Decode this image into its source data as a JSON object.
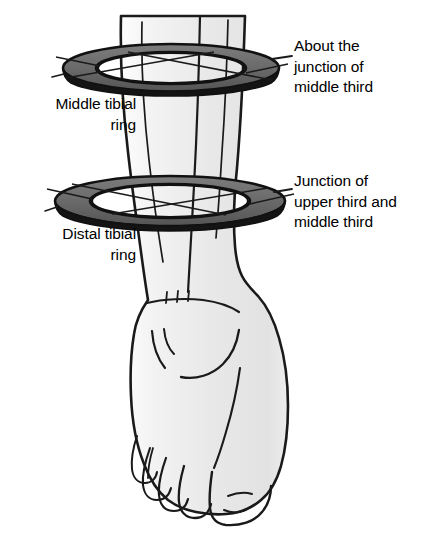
{
  "figure": {
    "type": "anatomical-line-diagram",
    "background_color": "#ffffff"
  },
  "labels": {
    "upper_right": {
      "text": "About the\njunction of\nmiddle third",
      "lines": [
        "About the",
        "junction of",
        "middle third"
      ],
      "align": "left",
      "color": "#000000",
      "points_to": "middle-tibial-ring"
    },
    "lower_right": {
      "text": "Junction of\nupper third and\nmiddle third",
      "lines": [
        "Junction of",
        "upper third and",
        "middle third"
      ],
      "align": "left",
      "color": "#000000",
      "points_to": "distal-tibial-ring"
    },
    "upper_left": {
      "text": "Middle tibial\nring",
      "lines": [
        "Middle tibial",
        "ring"
      ],
      "align": "right",
      "color": "#000000",
      "points_to": "middle-tibial-ring"
    },
    "lower_left": {
      "text": "Distal tibial\nring",
      "lines": [
        "Distal tibial",
        "ring"
      ],
      "align": "right",
      "color": "#000000",
      "points_to": "distal-tibial-ring"
    }
  },
  "anatomy": {
    "limb_name": "lower-leg-and-foot",
    "fill_color": "#e9e9e9",
    "outline_color": "#1a1a1a",
    "parts": [
      "shin",
      "ankle",
      "medial-malleolus",
      "foot-dorsum",
      "great-toe",
      "lesser-toes"
    ]
  },
  "rings": [
    {
      "name": "middle-tibial-ring",
      "label": "Middle tibial ring",
      "band_color": "#6e6e6e",
      "outline_color": "#111111",
      "center_x": 171,
      "center_y": 68,
      "radius_x": 108,
      "radius_y": 24,
      "band_depth": 14
    },
    {
      "name": "distal-tibial-ring",
      "label": "Distal tibial ring",
      "band_color": "#6e6e6e",
      "outline_color": "#111111",
      "center_x": 170,
      "center_y": 201,
      "radius_x": 115,
      "radius_y": 25,
      "band_depth": 15
    }
  ],
  "leader_lines": {
    "color": "#1a1a1a",
    "count": 4
  }
}
